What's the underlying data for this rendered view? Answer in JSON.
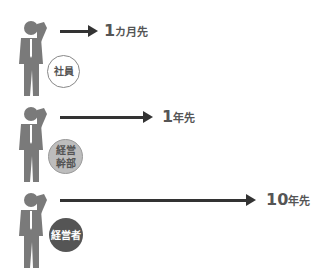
{
  "rows": [
    {
      "role": "社員",
      "horizon_number": "1",
      "horizon_unit": "カ月先",
      "badge_style": "outline",
      "badge_bg": "#ffffff",
      "badge_text_color": "#555555"
    },
    {
      "role_line1": "経営",
      "role_line2": "幹部",
      "horizon_number": "1",
      "horizon_unit": "年先",
      "badge_style": "light-fill",
      "badge_bg": "#bdbdbd",
      "badge_text_color": "#555555"
    },
    {
      "role": "経営者",
      "horizon_number": "10",
      "horizon_unit": "年先",
      "badge_style": "dark-fill",
      "badge_bg": "#555555",
      "badge_text_color": "#ffffff"
    }
  ],
  "colors": {
    "figure": "#7a7a7a",
    "arrow": "#333333",
    "text": "#555555"
  }
}
